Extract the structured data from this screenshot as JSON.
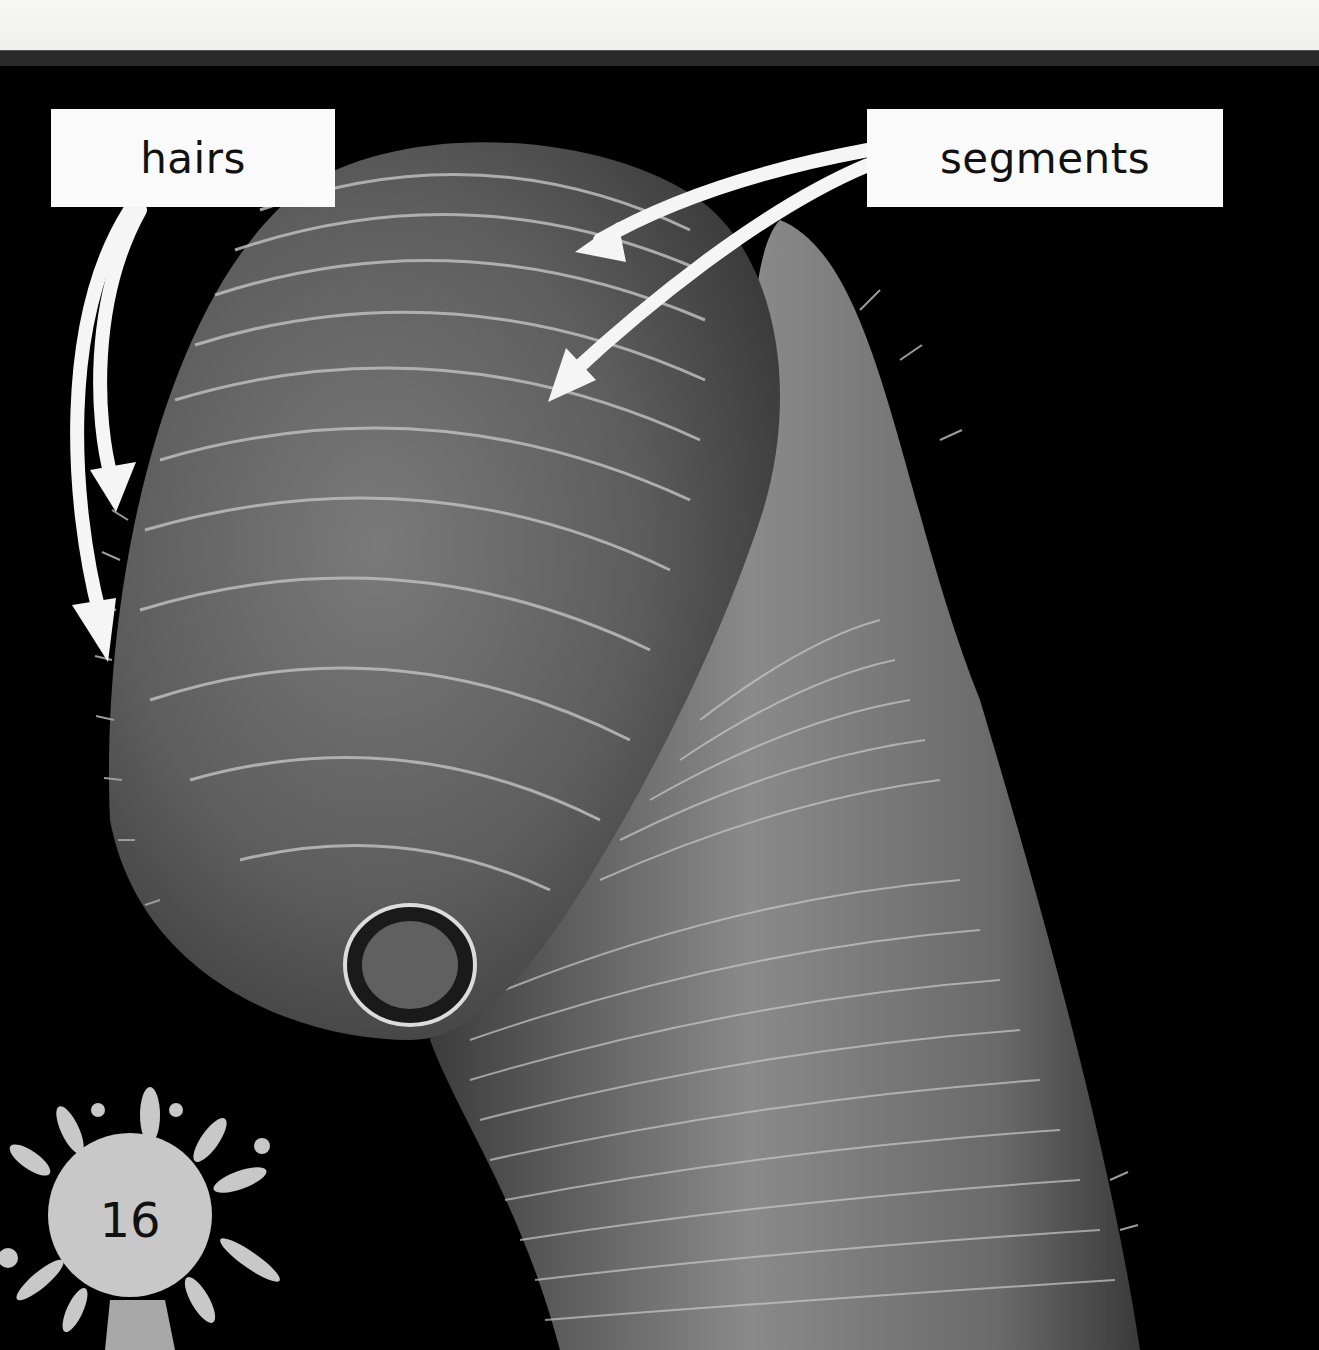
{
  "page": {
    "page_number": "16",
    "colors": {
      "background": "#000000",
      "label_fill": "#fafafa",
      "label_text": "#111111",
      "arrow": "#f5f5f5",
      "splat": "#c8c8c8"
    }
  },
  "figure": {
    "labels": [
      {
        "id": "hairs",
        "text": "hairs",
        "arrow_count": 2
      },
      {
        "id": "segments",
        "text": "segments",
        "arrow_count": 2
      }
    ]
  }
}
